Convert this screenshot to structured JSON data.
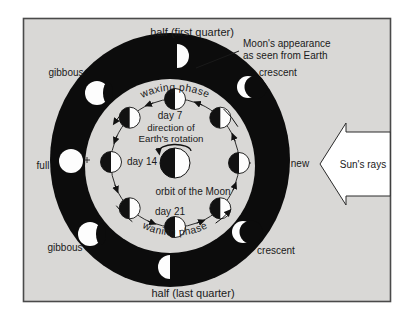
{
  "figure": {
    "title_top": "half (first quarter)",
    "title_bottom": "half (last quarter)",
    "annotation": {
      "line1": "Moon's appearance",
      "line2": "as seen from Earth"
    },
    "outer_phase_labels": {
      "crescent_upper": "crescent",
      "gibbous_upper": "gibbous",
      "full": "full",
      "new": "new",
      "gibbous_lower": "gibbous",
      "crescent_lower": "crescent"
    },
    "inner_labels": {
      "waxing": "waxing phase",
      "waning": "waning phase",
      "day7": "day 7",
      "day14": "day 14",
      "day21": "day 21",
      "rotation_line1": "direction of",
      "rotation_line2": "Earth's rotation",
      "orbit": "orbit of the Moon"
    },
    "sun_label": "Sun's rays",
    "colors": {
      "background": "#d9d8d6",
      "ring": "#0c0c0c",
      "moon_light": "#fdfdfd",
      "text": "#1a1a1a",
      "border": "#4a4a4a"
    },
    "diagram_semantics": {
      "type": "moon-phase-diagram",
      "earth": "center, left half dark / right half lit, rotates counterclockwise",
      "sun_direction": "rays arrive from the right",
      "inner_orbit_moons": "8 moons, left half dark / right half lit, counterclockwise orbit",
      "outer_ring_phases_clockwise_from_top": [
        "first quarter half",
        "crescent",
        "new (invisible)",
        "crescent",
        "last quarter half",
        "gibbous",
        "full",
        "gibbous"
      ],
      "day_markers": {
        "day7": "top of orbit",
        "day14": "left of orbit",
        "day21": "bottom of orbit"
      }
    }
  }
}
